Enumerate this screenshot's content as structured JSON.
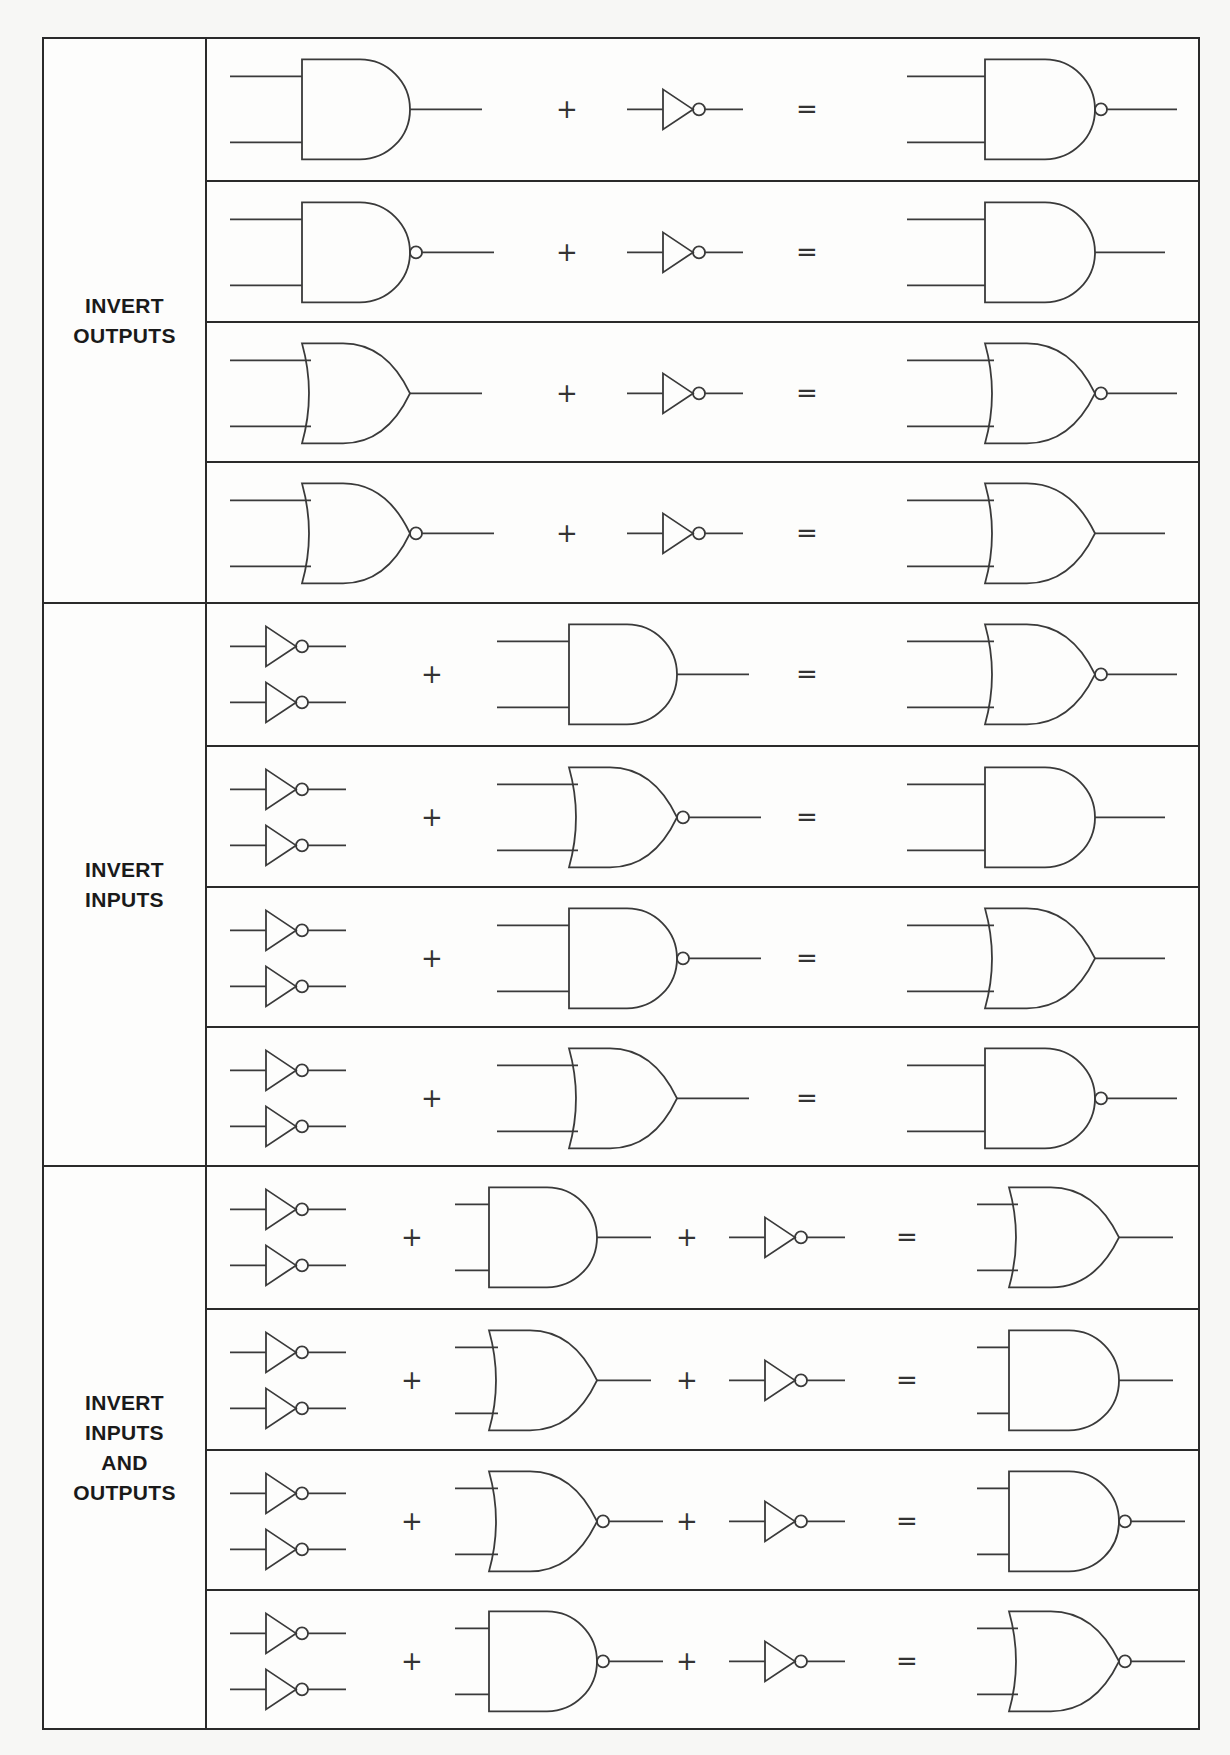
{
  "colors": {
    "line": "#2a2a2a",
    "gate": "#3a3a3a",
    "paper": "#fdfdfc"
  },
  "operators": {
    "plus": "+",
    "equals": "="
  },
  "groups": [
    {
      "label": "INVERT\nOUTPUTS",
      "rows": [
        {
          "terms": [
            "AND",
            "NOT"
          ],
          "result": "NAND"
        },
        {
          "terms": [
            "NAND",
            "NOT"
          ],
          "result": "AND"
        },
        {
          "terms": [
            "OR",
            "NOT"
          ],
          "result": "NOR"
        },
        {
          "terms": [
            "NOR",
            "NOT"
          ],
          "result": "OR"
        }
      ]
    },
    {
      "label": "INVERT\nINPUTS",
      "rows": [
        {
          "terms": [
            "2xNOT",
            "AND"
          ],
          "result": "NOR"
        },
        {
          "terms": [
            "2xNOT",
            "NOR"
          ],
          "result": "AND"
        },
        {
          "terms": [
            "2xNOT",
            "NAND"
          ],
          "result": "OR"
        },
        {
          "terms": [
            "2xNOT",
            "OR"
          ],
          "result": "NAND"
        }
      ]
    },
    {
      "label": "INVERT\nINPUTS\nAND\nOUTPUTS",
      "rows": [
        {
          "terms": [
            "2xNOT",
            "AND",
            "NOT"
          ],
          "result": "OR"
        },
        {
          "terms": [
            "2xNOT",
            "OR",
            "NOT"
          ],
          "result": "AND"
        },
        {
          "terms": [
            "2xNOT",
            "NOR",
            "NOT"
          ],
          "result": "NAND"
        },
        {
          "terms": [
            "2xNOT",
            "NAND",
            "NOT"
          ],
          "result": "NOR"
        }
      ]
    }
  ]
}
